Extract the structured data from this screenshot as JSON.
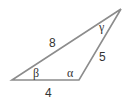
{
  "diagram": {
    "type": "triangle",
    "stroke_color": "#8c8c8c",
    "text_color": "#333333",
    "vertices": {
      "bottom_left": [
        12,
        80
      ],
      "bottom_right": [
        79,
        80
      ],
      "top_right": [
        121,
        9
      ]
    },
    "sides": {
      "hypotenuse": "8",
      "right": "5",
      "bottom": "4"
    },
    "angles": {
      "beta": "β",
      "alpha": "α",
      "gamma": "γ"
    }
  }
}
